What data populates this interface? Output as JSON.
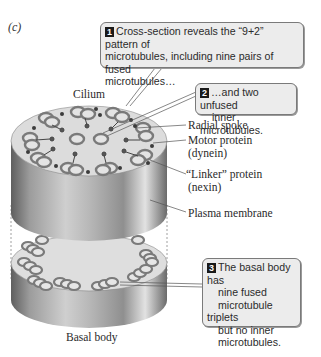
{
  "panel": {
    "label": "(c)"
  },
  "structures": {
    "cilium": "Cilium",
    "basal_body": "Basal body"
  },
  "labels": {
    "radial_spoke": "Radial spoke",
    "motor_protein_line1": "Motor protein",
    "motor_protein_line2": "(dynein)",
    "linker_protein_line1": "“Linker” protein",
    "linker_protein_line2": "(nexin)",
    "plasma_membrane": "Plasma membrane"
  },
  "callouts": [
    {
      "number": "1",
      "lines": [
        "Cross-section reveals the “9+2” pattern of",
        "microtubules, including nine pairs of fused",
        "microtubules…"
      ]
    },
    {
      "number": "2",
      "lines": [
        "…and two unfused",
        "inner microtubules."
      ]
    },
    {
      "number": "3",
      "lines": [
        "The basal body has",
        "nine fused",
        "microtubule triplets",
        "but no inner",
        "microtubules."
      ]
    }
  ],
  "colors": {
    "cylinder_dark": "#6e6e6e",
    "cylinder_light": "#e8e8e8",
    "face": "#dcdcdc",
    "microtubule": "#8a8a8a",
    "callout_bg": "#ececec",
    "badge": "#1a1a1a"
  }
}
